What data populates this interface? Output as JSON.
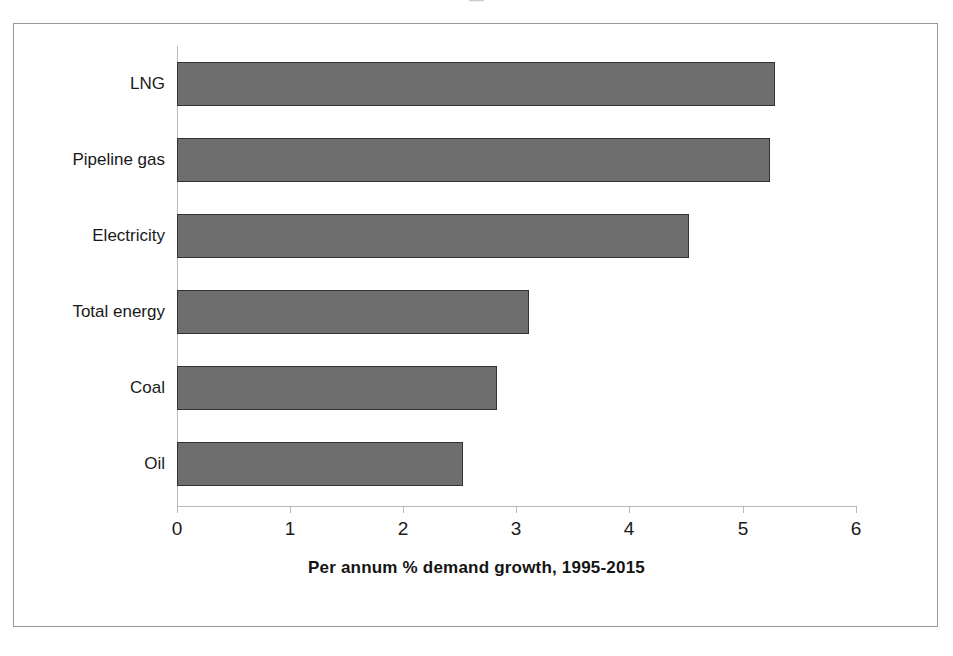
{
  "artifact": {
    "clipped_top_text": "—"
  },
  "chart_data": {
    "type": "bar",
    "orientation": "horizontal",
    "title": "",
    "xlabel": "Per annum % demand growth, 1995-2015",
    "ylabel": "",
    "categories": [
      "LNG",
      "Pipeline gas",
      "Electricity",
      "Total energy",
      "Coal",
      "Oil"
    ],
    "values": [
      5.28,
      5.24,
      4.52,
      3.11,
      2.83,
      2.53
    ],
    "series": [
      {
        "name": "Per annum % demand growth, 1995-2015",
        "values": [
          5.28,
          5.24,
          4.52,
          3.11,
          2.83,
          2.53
        ]
      }
    ],
    "xlim": [
      0,
      6
    ],
    "xticks": [
      "0",
      "1",
      "2",
      "3",
      "4",
      "5",
      "6"
    ],
    "xtick_values": [
      0,
      1,
      2,
      3,
      4,
      5,
      6
    ],
    "grid": false,
    "legend": false,
    "legend_position": "none",
    "bar_color": "#6e6e6e",
    "bar_border_color": "#333333",
    "background_color": "#ffffff",
    "frame_color": "#9a9a9a",
    "axis_color": "#b9b9b9"
  }
}
